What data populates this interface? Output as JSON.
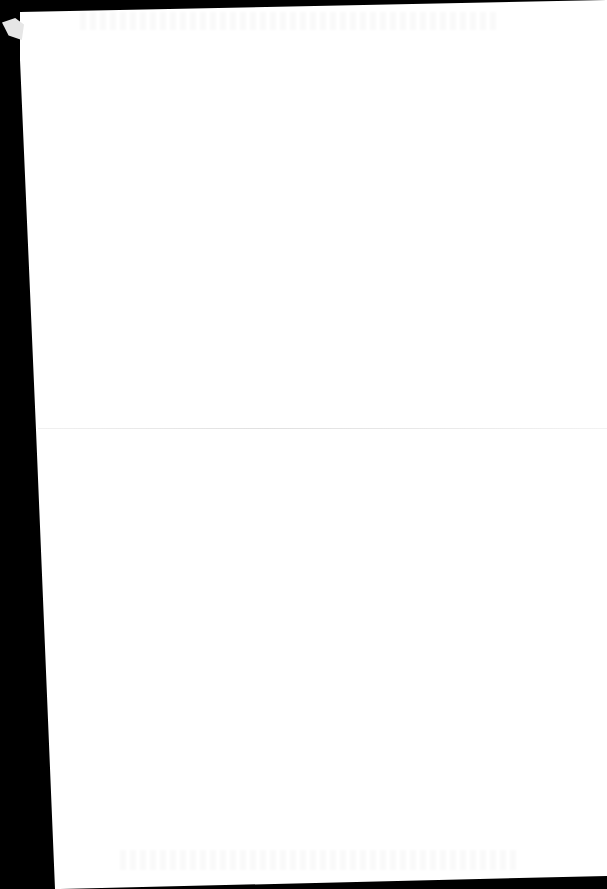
{
  "document": {
    "type": "scanned blank page",
    "text": "",
    "colors": {
      "paper": "#ffffff",
      "scan_background": "#000000"
    },
    "features": [
      "horizontal fold line",
      "faint bleed-through at top and bottom",
      "skewed page edge"
    ]
  }
}
